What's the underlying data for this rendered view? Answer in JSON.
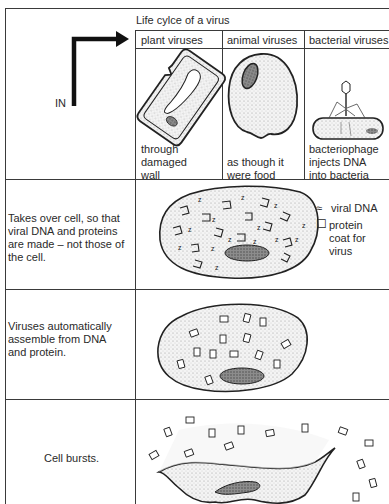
{
  "title": "Life cylce of a virus",
  "entry_label": "IN",
  "columns": [
    {
      "header": "plant viruses",
      "caption": [
        "through",
        "damaged",
        "wall"
      ]
    },
    {
      "header": "animal viruses",
      "caption": [
        "as though it",
        "were food"
      ]
    },
    {
      "header": "bacterial viruses",
      "caption": [
        "bacteriophage",
        "injects DNA",
        "into bacteria"
      ]
    }
  ],
  "stages": [
    {
      "text": [
        "Takes over cell, so that",
        "viral DNA and proteins",
        "are made – not those of",
        "the cell."
      ]
    },
    {
      "text": [
        "Viruses automatically",
        "assemble from DNA",
        "and protein."
      ]
    },
    {
      "text": [
        "Cell bursts."
      ]
    }
  ],
  "legend": [
    {
      "symbol": "≈",
      "icon": "viral-dna-symbol",
      "label": [
        "viral DNA"
      ]
    },
    {
      "symbol": "☐",
      "icon": "protein-coat-symbol",
      "label": [
        "protein",
        "coat for",
        "virus"
      ]
    }
  ],
  "colors": {
    "line": "#3a3a3a",
    "stipple": "#e6e6e6",
    "nucleus": "#8a8a8a"
  }
}
